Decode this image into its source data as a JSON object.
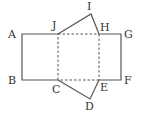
{
  "diagram": {
    "colors": {
      "line": "#555555",
      "label": "#333333",
      "background": "#ffffff"
    },
    "points": {
      "A": [
        22,
        34
      ],
      "B": [
        22,
        80
      ],
      "J": [
        58,
        34
      ],
      "C": [
        58,
        80
      ],
      "H": [
        99,
        34
      ],
      "E": [
        99,
        80
      ],
      "G": [
        121,
        34
      ],
      "F": [
        121,
        80
      ],
      "I": [
        91,
        14
      ],
      "D": [
        90,
        99
      ]
    },
    "labels": {
      "A": "A",
      "B": "B",
      "C": "C",
      "D": "D",
      "E": "E",
      "F": "F",
      "G": "G",
      "H": "H",
      "I": "I",
      "J": "J"
    },
    "solid_edges": [
      "A-J",
      "J-I",
      "I-H",
      "H-G",
      "G-F",
      "F-E",
      "E-D",
      "D-C",
      "C-B",
      "B-A"
    ],
    "dashed_edges": [
      "J-H",
      "H-E",
      "E-C",
      "C-J"
    ]
  }
}
